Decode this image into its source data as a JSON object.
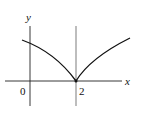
{
  "diagram": {
    "type": "function-graph",
    "labels": {
      "y_axis": "y",
      "x_axis": "x",
      "origin": "0",
      "cusp_x": "2"
    },
    "colors": {
      "stroke": "#111111",
      "background": "#ffffff"
    }
  }
}
